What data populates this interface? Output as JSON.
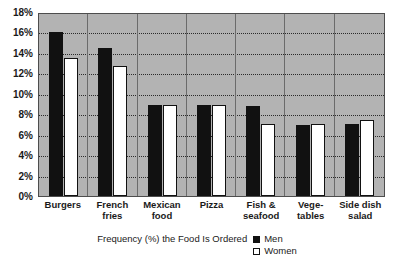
{
  "chart_data": {
    "type": "bar",
    "title": "",
    "xlabel": "Frequency (%) the Food Is Ordered",
    "ylabel": "",
    "ylim": [
      0,
      18
    ],
    "ytick_step": 2,
    "grid": true,
    "legend_position": "bottom",
    "categories": [
      "Burgers",
      "French fries",
      "Mexican food",
      "Pizza",
      "Fish & seafood",
      "Vegetables",
      "Side dish salad"
    ],
    "category_labels": [
      [
        "Burgers"
      ],
      [
        "French",
        "fries"
      ],
      [
        "Mexican",
        "food"
      ],
      [
        "Pizza"
      ],
      [
        "Fish &",
        "seafood"
      ],
      [
        "Vege-",
        "tables"
      ],
      [
        "Side dish",
        "salad"
      ]
    ],
    "ytick_labels": [
      "18%",
      "16%",
      "14%",
      "12%",
      "10%",
      "8%",
      "6%",
      "4%",
      "2%",
      "0%"
    ],
    "ytick_values": [
      18,
      16,
      14,
      12,
      10,
      8,
      6,
      4,
      2,
      0
    ],
    "series": [
      {
        "name": "Men",
        "color": "#111111",
        "values": [
          16.0,
          14.5,
          8.9,
          8.9,
          8.8,
          6.9,
          7.0
        ]
      },
      {
        "name": "Women",
        "color": "#ffffff",
        "values": [
          13.5,
          12.7,
          8.9,
          8.9,
          7.0,
          7.0,
          7.4
        ]
      }
    ]
  },
  "legend": {
    "axis_title": "Frequency (%) the Food Is Ordered",
    "entries": [
      {
        "label": "Men",
        "swatch": "filled-square-icon"
      },
      {
        "label": "Women",
        "swatch": "open-square-icon"
      }
    ]
  },
  "colors": {
    "plot_background": "#b3b3b3",
    "page_background": "#ffffff",
    "axis": "#4d4d4d",
    "gridline": "#2b2b2b",
    "men_bar": "#111111",
    "women_bar": "#ffffff",
    "text": "#1a1a1a"
  }
}
